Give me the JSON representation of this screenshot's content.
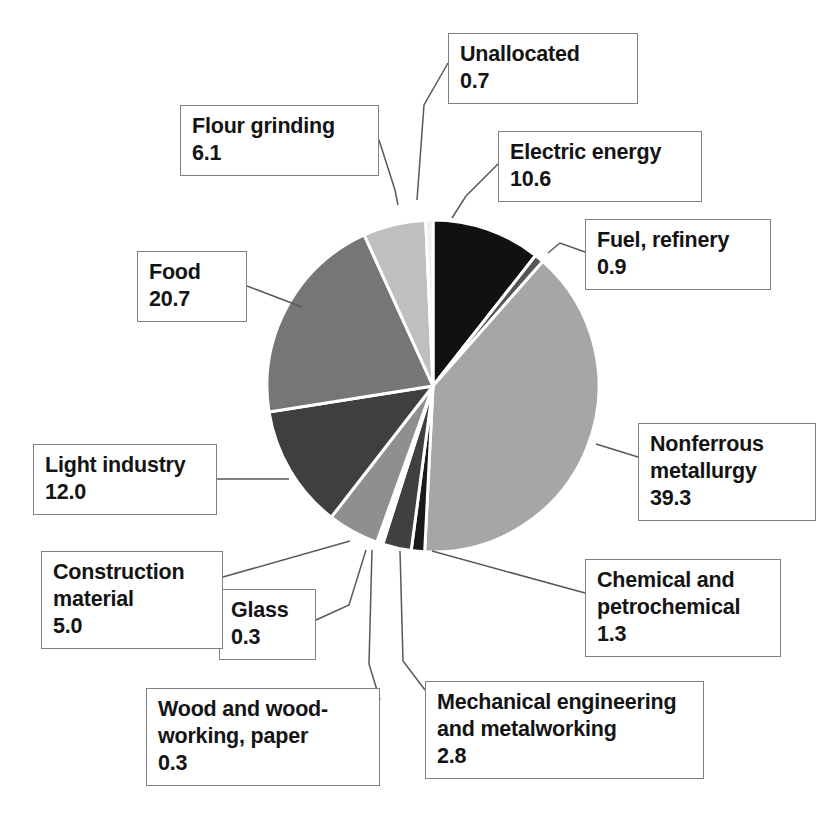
{
  "chart_data": {
    "type": "pie",
    "title": "",
    "subtitle": "",
    "xlabel": "",
    "ylabel": "",
    "legend_position": "none",
    "grid": false,
    "units": "percent",
    "total": 100.0,
    "start_angle_deg": 0,
    "direction": "clockwise",
    "categories": [
      "Electric energy",
      "Fuel, refinery",
      "Nonferrous metallurgy",
      "Chemical and petrochemical",
      "Mechanical engineering and metalworking",
      "Wood and wood-working, paper",
      "Glass",
      "Construction material",
      "Light industry",
      "Food",
      "Flour grinding",
      "Unallocated"
    ],
    "values": [
      10.6,
      0.9,
      39.3,
      1.3,
      2.8,
      0.3,
      0.3,
      5.0,
      12.0,
      20.7,
      6.1,
      0.7
    ],
    "colors": [
      "#111111",
      "#565656",
      "#a6a6a6",
      "#1a1a1a",
      "#404040",
      "#8c8c8c",
      "#d9d9d9",
      "#8f8f8f",
      "#3f3f3f",
      "#767676",
      "#bfbfbf",
      "#efefef"
    ],
    "slice_separator_color": "#ffffff",
    "slice_separator_width_px": 3
  },
  "pie": {
    "center_x": 433,
    "center_y": 386,
    "radius": 166,
    "slices": [
      {
        "label": "Electric energy",
        "value": 10.6,
        "color": "#111111",
        "start": 0.0,
        "end": 38.16
      },
      {
        "label": "Fuel, refinery",
        "value": 0.9,
        "color": "#565656",
        "start": 38.16,
        "end": 41.4
      },
      {
        "label": "Nonferrous metallurgy",
        "value": 39.3,
        "color": "#a6a6a6",
        "start": 41.4,
        "end": 182.88
      },
      {
        "label": "Chemical and petrochemical",
        "value": 1.3,
        "color": "#1a1a1a",
        "start": 182.88,
        "end": 187.56
      },
      {
        "label": "Mechanical engineering and metalworking",
        "value": 2.8,
        "color": "#404040",
        "start": 187.56,
        "end": 197.64
      },
      {
        "label": "Wood and wood-working, paper",
        "value": 0.3,
        "color": "#8c8c8c",
        "start": 197.64,
        "end": 198.72
      },
      {
        "label": "Glass",
        "value": 0.3,
        "color": "#d9d9d9",
        "start": 198.72,
        "end": 199.8
      },
      {
        "label": "Construction material",
        "value": 5.0,
        "color": "#8f8f8f",
        "start": 199.8,
        "end": 217.8
      },
      {
        "label": "Light industry",
        "value": 12.0,
        "color": "#3f3f3f",
        "start": 217.8,
        "end": 261.0
      },
      {
        "label": "Food",
        "value": 20.7,
        "color": "#767676",
        "start": 261.0,
        "end": 335.52
      },
      {
        "label": "Flour grinding",
        "value": 6.1,
        "color": "#bfbfbf",
        "start": 335.52,
        "end": 357.48
      },
      {
        "label": "Unallocated",
        "value": 0.7,
        "color": "#efefef",
        "start": 357.48,
        "end": 360.0
      }
    ]
  },
  "callouts": [
    {
      "name": "unallocated",
      "caption": "Unallocated",
      "value": "0.7",
      "x": 448,
      "y": 33,
      "w": 190,
      "h": 64,
      "line": [
        [
          448,
          63
        ],
        [
          424,
          105
        ],
        [
          417,
          200
        ]
      ]
    },
    {
      "name": "electric-energy",
      "caption": "Electric energy",
      "value": "10.6",
      "x": 498,
      "y": 131,
      "w": 204,
      "h": 66,
      "line": [
        [
          498,
          164
        ],
        [
          466,
          196
        ],
        [
          452,
          218
        ]
      ]
    },
    {
      "name": "fuel-refinery",
      "caption": "Fuel, refinery",
      "value": "0.9",
      "x": 585,
      "y": 219,
      "w": 186,
      "h": 66,
      "line": [
        [
          585,
          252
        ],
        [
          560,
          243
        ],
        [
          548,
          253
        ]
      ]
    },
    {
      "name": "nonferrous",
      "caption": "Nonferrous\nmetallurgy",
      "value": "39.3",
      "x": 638,
      "y": 423,
      "w": 178,
      "h": 96,
      "line": [
        [
          638,
          457
        ],
        [
          596,
          444
        ]
      ]
    },
    {
      "name": "chemical",
      "caption": "Chemical and\npetrochemical",
      "value": "1.3",
      "x": 585,
      "y": 559,
      "w": 196,
      "h": 96,
      "line": [
        [
          585,
          593
        ],
        [
          432,
          551
        ]
      ]
    },
    {
      "name": "mechanical",
      "caption": "Mechanical engineering\nand metalworking",
      "value": "2.8",
      "x": 425,
      "y": 681,
      "w": 279,
      "h": 96,
      "line": [
        [
          425,
          690
        ],
        [
          403,
          661
        ],
        [
          400,
          551
        ]
      ]
    },
    {
      "name": "wood",
      "caption": "Wood and wood-\nworking, paper",
      "value": "0.3",
      "x": 146,
      "y": 688,
      "w": 234,
      "h": 96,
      "line": [
        [
          380,
          700
        ],
        [
          369,
          664
        ],
        [
          372,
          550
        ]
      ]
    },
    {
      "name": "glass",
      "caption": "Glass",
      "value": "0.3",
      "x": 219,
      "y": 589,
      "w": 97,
      "h": 66,
      "line": [
        [
          316,
          620
        ],
        [
          349,
          605
        ],
        [
          366,
          550
        ]
      ]
    },
    {
      "name": "construction",
      "caption": "Construction\nmaterial",
      "value": "5.0",
      "x": 41,
      "y": 551,
      "w": 182,
      "h": 96,
      "line": [
        [
          223,
          577
        ],
        [
          350,
          541
        ]
      ]
    },
    {
      "name": "light-industry",
      "caption": "Light industry",
      "value": "12.0",
      "x": 33,
      "y": 444,
      "w": 184,
      "h": 66,
      "line": [
        [
          217,
          479
        ],
        [
          289,
          479
        ]
      ]
    },
    {
      "name": "food",
      "caption": "Food",
      "value": "20.7",
      "x": 137,
      "y": 251,
      "w": 110,
      "h": 66,
      "line": [
        [
          247,
          286
        ],
        [
          302,
          307
        ]
      ]
    },
    {
      "name": "flour-grinding",
      "caption": "Flour grinding",
      "value": "6.1",
      "x": 180,
      "y": 105,
      "w": 199,
      "h": 66,
      "line": [
        [
          379,
          140
        ],
        [
          395,
          190
        ],
        [
          398,
          205
        ]
      ]
    }
  ]
}
